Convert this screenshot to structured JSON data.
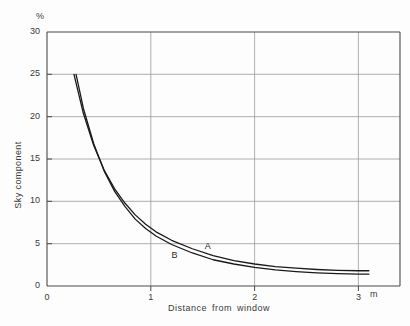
{
  "chart_data": {
    "type": "line",
    "title": "",
    "xlabel": "Distance from window",
    "ylabel": "Sky component",
    "x_unit": "m",
    "y_unit": "%",
    "xlim": [
      0,
      3.4
    ],
    "ylim": [
      0,
      30
    ],
    "xticks": [
      0,
      1,
      2,
      3
    ],
    "xtick_labels": [
      "0",
      "1",
      "2",
      "3"
    ],
    "yticks": [
      0,
      5,
      10,
      15,
      20,
      25,
      30
    ],
    "ytick_labels": [
      "0",
      "5",
      "10",
      "15",
      "20",
      "25",
      "30"
    ],
    "grid": true,
    "legend": "inline-curve-labels",
    "series": [
      {
        "name": "A",
        "label": "A",
        "label_x": 1.52,
        "label_y": 4.6,
        "points": [
          [
            0.26,
            25.0
          ],
          [
            0.35,
            20.4
          ],
          [
            0.45,
            16.6
          ],
          [
            0.55,
            13.7
          ],
          [
            0.65,
            11.5
          ],
          [
            0.75,
            9.8
          ],
          [
            0.85,
            8.4
          ],
          [
            0.95,
            7.3
          ],
          [
            1.05,
            6.4
          ],
          [
            1.2,
            5.4
          ],
          [
            1.4,
            4.4
          ],
          [
            1.6,
            3.6
          ],
          [
            1.8,
            3.0
          ],
          [
            2.0,
            2.6
          ],
          [
            2.2,
            2.3
          ],
          [
            2.4,
            2.1
          ],
          [
            2.6,
            1.95
          ],
          [
            2.8,
            1.85
          ],
          [
            3.0,
            1.8
          ],
          [
            3.1,
            1.8
          ]
        ]
      },
      {
        "name": "B",
        "label": "B",
        "label_x": 1.2,
        "label_y": 3.5,
        "points": [
          [
            0.28,
            25.0
          ],
          [
            0.35,
            21.0
          ],
          [
            0.45,
            16.8
          ],
          [
            0.55,
            13.6
          ],
          [
            0.65,
            11.2
          ],
          [
            0.75,
            9.4
          ],
          [
            0.85,
            7.9
          ],
          [
            0.95,
            6.8
          ],
          [
            1.05,
            5.9
          ],
          [
            1.2,
            4.9
          ],
          [
            1.4,
            3.9
          ],
          [
            1.6,
            3.1
          ],
          [
            1.8,
            2.6
          ],
          [
            2.0,
            2.2
          ],
          [
            2.2,
            1.9
          ],
          [
            2.4,
            1.7
          ],
          [
            2.6,
            1.55
          ],
          [
            2.8,
            1.45
          ],
          [
            3.0,
            1.4
          ],
          [
            3.1,
            1.4
          ]
        ]
      }
    ]
  },
  "colors": {
    "curve": "#1a1a1a",
    "axis": "#555555",
    "grid": "#9a9a9a",
    "text": "#3a3a3a",
    "background": "#fdfdfd"
  }
}
